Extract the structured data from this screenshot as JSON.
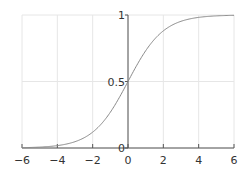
{
  "chart_data": {
    "type": "line",
    "title": "",
    "xlabel": "",
    "ylabel": "",
    "xlim": [
      -6,
      6
    ],
    "ylim": [
      0,
      1
    ],
    "grid": true,
    "legend": null,
    "x_ticks": [
      "-6",
      "-4",
      "-2",
      "0",
      "2",
      "4",
      "6"
    ],
    "y_ticks": [
      "0",
      "0.5",
      "1"
    ],
    "series": [
      {
        "name": "sigmoid",
        "function": "1/(1+exp(-x))",
        "color": "#888888",
        "x": [
          -6,
          -5,
          -4,
          -3,
          -2,
          -1,
          0,
          1,
          2,
          3,
          4,
          5,
          6
        ],
        "values": [
          0.0025,
          0.0067,
          0.018,
          0.047,
          0.119,
          0.269,
          0.5,
          0.731,
          0.881,
          0.953,
          0.982,
          0.993,
          0.9975
        ]
      }
    ]
  },
  "colors": {
    "grid": "#e6e6e6",
    "axis": "#555555",
    "curve": "#888888"
  }
}
